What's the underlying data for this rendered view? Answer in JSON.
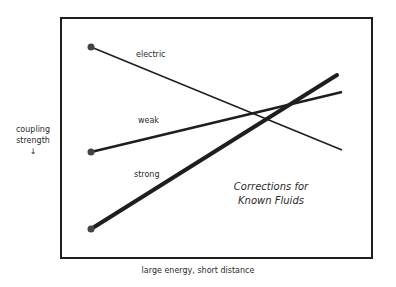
{
  "diagram": {
    "y_axis_label_line1": "coupling",
    "y_axis_label_line2": "strength",
    "y_axis_arrow": "↓",
    "x_axis_label": "large energy, short distance",
    "annotation_line1": "Corrections for",
    "annotation_line2": "Known Fluids",
    "lines": [
      {
        "name": "electric",
        "label": "electric",
        "start": [
          91,
          47
        ],
        "end": [
          342,
          150
        ],
        "stroke_width": 1.5
      },
      {
        "name": "weak",
        "label": "weak",
        "start": [
          91,
          152
        ],
        "end": [
          342,
          92
        ],
        "stroke_width": 2.5
      },
      {
        "name": "strong",
        "label": "strong",
        "start": [
          91,
          229
        ],
        "end": [
          337,
          75
        ],
        "stroke_width": 4
      }
    ],
    "colors": {
      "line": "#1e1e1e",
      "frame": "#1e1e1e",
      "dot": "#444444"
    }
  }
}
